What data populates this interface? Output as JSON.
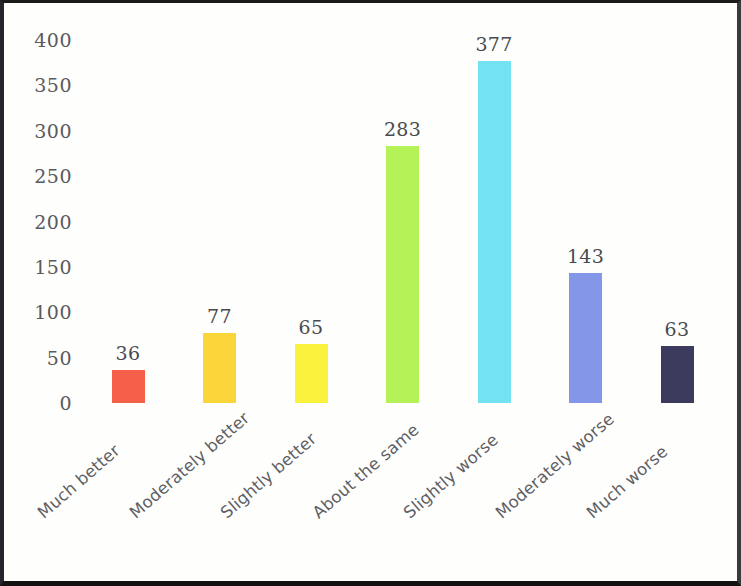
{
  "chart_data": {
    "type": "bar",
    "title": "",
    "subtitle": "",
    "xlabel": "",
    "ylabel": "",
    "categories": [
      "Much better",
      "Moderately better",
      "Slightly better",
      "About the same",
      "Slightly worse",
      "Moderately worse",
      "Much worse"
    ],
    "values": [
      36,
      77,
      65,
      283,
      377,
      143,
      63
    ],
    "bar_colors": [
      "#F4604A",
      "#FBD63B",
      "#FAF23C",
      "#B4F257",
      "#73E2F2",
      "#8396E8",
      "#3C3B5D"
    ],
    "data_labels": [
      "36",
      "77",
      "65",
      "283",
      "377",
      "143",
      "63"
    ],
    "ylim": [
      0,
      400
    ],
    "ytick_labels": [
      "400",
      "350",
      "300",
      "250",
      "200",
      "150",
      "100",
      "50",
      "0"
    ],
    "ytick_values": [
      400,
      350,
      300,
      250,
      200,
      150,
      100,
      50,
      0
    ],
    "grid": false,
    "legend": "none",
    "axis_line": "none",
    "frame": "image-border"
  }
}
